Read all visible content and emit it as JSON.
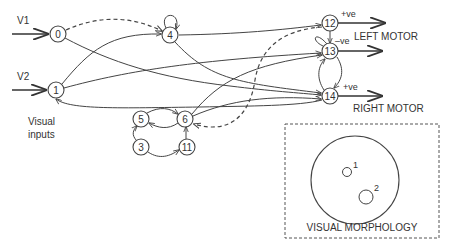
{
  "diagram": {
    "type": "neural-network-controller",
    "inputs": [
      {
        "label": "V1",
        "target_node": "0"
      },
      {
        "label": "V2",
        "target_node": "1"
      }
    ],
    "inputs_caption_line1": "Visual",
    "inputs_caption_line2": "inputs",
    "nodes": [
      {
        "id": "0",
        "x": 58,
        "y": 34
      },
      {
        "id": "1",
        "x": 56,
        "y": 90
      },
      {
        "id": "4",
        "x": 170,
        "y": 35
      },
      {
        "id": "5",
        "x": 141,
        "y": 119
      },
      {
        "id": "6",
        "x": 185,
        "y": 119
      },
      {
        "id": "3",
        "x": 141,
        "y": 147
      },
      {
        "id": "11",
        "x": 187,
        "y": 147
      },
      {
        "id": "12",
        "x": 330,
        "y": 23
      },
      {
        "id": "13",
        "x": 330,
        "y": 51
      },
      {
        "id": "14",
        "x": 330,
        "y": 96
      }
    ],
    "outputs": {
      "left_motor_label": "LEFT MOTOR",
      "right_motor_label": "RIGHT MOTOR",
      "sign_12": "+ve",
      "sign_13": "–ve",
      "sign_14": "+ve"
    },
    "edges": [
      {
        "from": "0",
        "to": "4",
        "style": "dashed"
      },
      {
        "from": "4",
        "to": "4",
        "style": "solid"
      },
      {
        "from": "0",
        "to": "14",
        "style": "solid"
      },
      {
        "from": "1",
        "to": "4",
        "style": "solid"
      },
      {
        "from": "1",
        "to": "13",
        "style": "solid"
      },
      {
        "from": "4",
        "to": "12",
        "style": "solid"
      },
      {
        "from": "4",
        "to": "14",
        "style": "solid"
      },
      {
        "from": "14",
        "to": "1",
        "style": "solid"
      },
      {
        "from": "6",
        "to": "13",
        "style": "solid"
      },
      {
        "from": "6",
        "to": "14",
        "style": "solid"
      },
      {
        "from": "12",
        "to": "6",
        "style": "dashed"
      },
      {
        "from": "12",
        "to": "13",
        "style": "solid"
      },
      {
        "from": "13",
        "to": "14",
        "style": "solid"
      },
      {
        "from": "14",
        "to": "13",
        "style": "solid"
      },
      {
        "from": "13",
        "to": "13",
        "style": "solid"
      },
      {
        "from": "5",
        "to": "6",
        "style": "solid"
      },
      {
        "from": "6",
        "to": "5",
        "style": "solid"
      },
      {
        "from": "3",
        "to": "5",
        "style": "solid"
      },
      {
        "from": "3",
        "to": "11",
        "style": "solid"
      },
      {
        "from": "11",
        "to": "6",
        "style": "solid"
      }
    ],
    "morphology": {
      "title": "VISUAL MORPHOLOGY",
      "sensor_1_label": "1",
      "sensor_2_label": "2"
    }
  }
}
